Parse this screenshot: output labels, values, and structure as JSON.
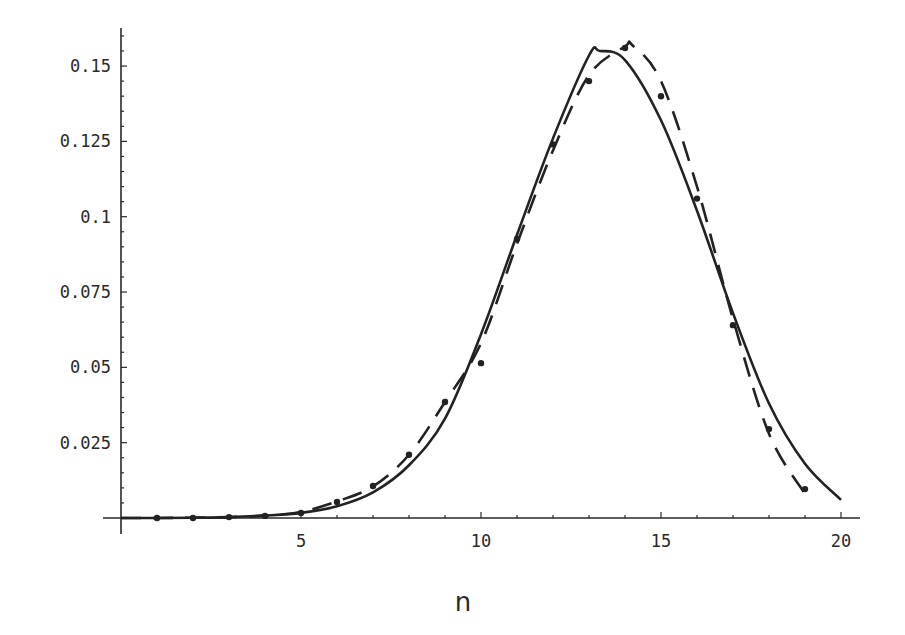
{
  "chart_data": {
    "type": "line",
    "title": "",
    "xlabel": "n",
    "ylabel": "",
    "xlim": [
      0,
      20
    ],
    "ylim": [
      0,
      0.16
    ],
    "grid": false,
    "legend": null,
    "x_ticks": [
      5,
      10,
      15,
      20
    ],
    "x_tick_labels": [
      "5",
      "10",
      "15",
      "20"
    ],
    "y_ticks": [
      0.025,
      0.05,
      0.075,
      0.1,
      0.125,
      0.15
    ],
    "y_tick_labels": [
      "0.025",
      "0.05",
      "0.075",
      "0.1",
      "0.125",
      "0.15"
    ],
    "series": [
      {
        "name": "solid curve",
        "style": "solid",
        "x": [
          0,
          1,
          2,
          3,
          4,
          5,
          6,
          7,
          8,
          9,
          10,
          11,
          12,
          13,
          13.3,
          14,
          15,
          16,
          17,
          18,
          19,
          20
        ],
        "values": [
          0,
          0,
          0.0001,
          0.0003,
          0.0008,
          0.0017,
          0.0039,
          0.0085,
          0.0175,
          0.033,
          0.061,
          0.094,
          0.126,
          0.1535,
          0.155,
          0.152,
          0.132,
          0.102,
          0.068,
          0.038,
          0.018,
          0.006
        ]
      },
      {
        "name": "dashed curve",
        "style": "dashed",
        "x": [
          0,
          1,
          2,
          3,
          4,
          5,
          6,
          7,
          8,
          9,
          10,
          11,
          12,
          13,
          14,
          14.2,
          15,
          16,
          17,
          18,
          19
        ],
        "values": [
          0,
          0,
          0.0001,
          0.0003,
          0.0008,
          0.002,
          0.0055,
          0.0105,
          0.021,
          0.0385,
          0.058,
          0.091,
          0.122,
          0.147,
          0.1565,
          0.157,
          0.145,
          0.11,
          0.066,
          0.028,
          0.008
        ]
      },
      {
        "name": "data points",
        "style": "dots",
        "x": [
          1,
          2,
          3,
          4,
          5,
          6,
          7,
          8,
          9,
          10,
          11,
          12,
          13,
          14,
          15,
          16,
          17,
          18,
          19
        ],
        "values": [
          0,
          0,
          0.0003,
          0.0007,
          0.0017,
          0.0053,
          0.0106,
          0.021,
          0.0385,
          0.0514,
          0.0926,
          0.124,
          0.145,
          0.156,
          0.14,
          0.106,
          0.064,
          0.0295,
          0.0096
        ]
      }
    ]
  }
}
